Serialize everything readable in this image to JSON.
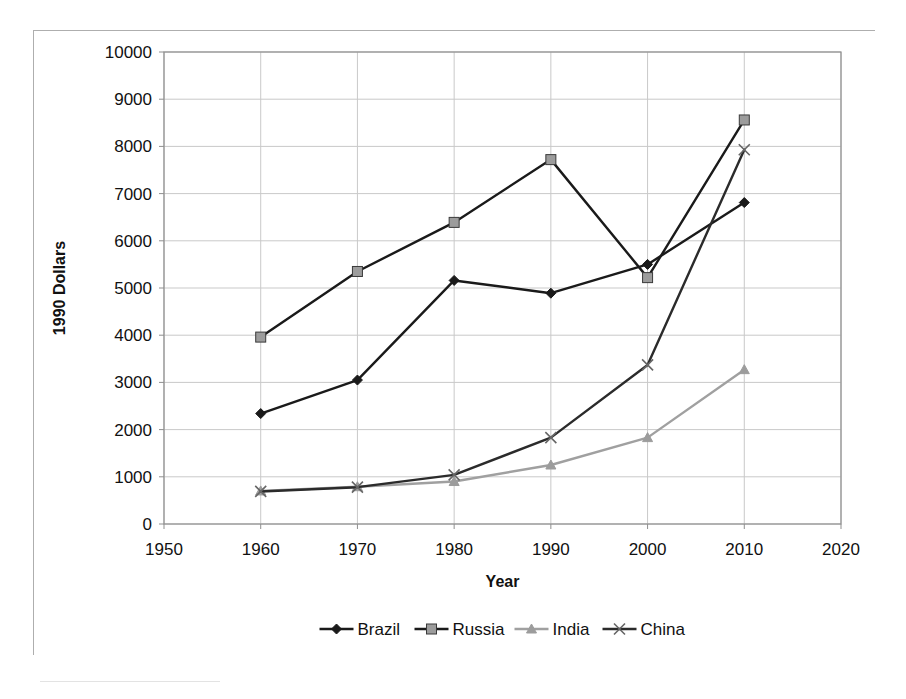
{
  "chart_data": {
    "type": "line",
    "title": "",
    "xlabel": "Year",
    "ylabel": "1990 Dollars",
    "x": [
      1960,
      1970,
      1980,
      1990,
      2000,
      2010
    ],
    "xlim": [
      1950,
      2020
    ],
    "ylim": [
      0,
      10000
    ],
    "xticks": [
      1950,
      1960,
      1970,
      1980,
      1990,
      2000,
      2010,
      2020
    ],
    "yticks": [
      0,
      1000,
      2000,
      3000,
      4000,
      5000,
      6000,
      7000,
      8000,
      9000,
      10000
    ],
    "xtick_labels": [
      "1950",
      "1960",
      "1970",
      "1980",
      "1990",
      "2000",
      "2010",
      "2020"
    ],
    "ytick_labels": [
      "0",
      "1000",
      "2000",
      "3000",
      "4000",
      "5000",
      "6000",
      "7000",
      "8000",
      "9000",
      "10000"
    ],
    "grid": true,
    "grid_axis": "both",
    "legend_position": "bottom",
    "series": [
      {
        "name": "Brazil",
        "values": [
          2340,
          3050,
          5160,
          4890,
          5500,
          6810
        ],
        "color": "#1a1a1a",
        "marker": "diamond",
        "marker_color": "#1a1a1a"
      },
      {
        "name": "Russia",
        "values": [
          3960,
          5350,
          6390,
          7720,
          5220,
          8560
        ],
        "color": "#1a1a1a",
        "marker": "square",
        "marker_color": "#9c9c9c"
      },
      {
        "name": "India",
        "values": [
          700,
          790,
          900,
          1250,
          1830,
          3270
        ],
        "color": "#a0a0a0",
        "marker": "triangle",
        "marker_color": "#9c9c9c"
      },
      {
        "name": "China",
        "values": [
          690,
          780,
          1040,
          1830,
          3370,
          7930
        ],
        "color": "#2b2b2b",
        "marker": "x",
        "marker_color": "#666666"
      }
    ]
  },
  "colors": {
    "frame_border": "#aeaeae",
    "plot_border": "#8f8f8f",
    "gridline": "#c9c9c9",
    "axis_text": "#111111",
    "background": "#ffffff"
  },
  "legend": {
    "entries": [
      {
        "label": "Brazil",
        "marker": "diamond"
      },
      {
        "label": "Russia",
        "marker": "square"
      },
      {
        "label": "India",
        "marker": "triangle"
      },
      {
        "label": "China",
        "marker": "x"
      }
    ]
  }
}
